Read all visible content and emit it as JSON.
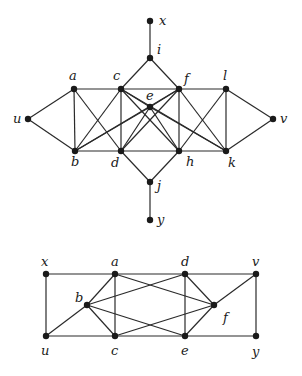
{
  "graphs": [
    {
      "id": "top-graph",
      "nodes": [
        {
          "id": "x",
          "label": "x",
          "x": 150,
          "y": 21,
          "lx": 159,
          "ly": 25
        },
        {
          "id": "i",
          "label": "i",
          "x": 150,
          "y": 58,
          "lx": 157,
          "ly": 54
        },
        {
          "id": "a",
          "label": "a",
          "x": 74,
          "y": 89,
          "lx": 69,
          "ly": 80
        },
        {
          "id": "c",
          "label": "c",
          "x": 121,
          "y": 89,
          "lx": 113,
          "ly": 80
        },
        {
          "id": "f",
          "label": "f",
          "x": 179,
          "y": 89,
          "lx": 184,
          "ly": 83
        },
        {
          "id": "l",
          "label": "l",
          "x": 226,
          "y": 89,
          "lx": 223,
          "ly": 80
        },
        {
          "id": "e",
          "label": "e",
          "x": 150,
          "y": 107,
          "lx": 146,
          "ly": 100
        },
        {
          "id": "u",
          "label": "u",
          "x": 28,
          "y": 119,
          "lx": 13,
          "ly": 123
        },
        {
          "id": "v",
          "label": "v",
          "x": 273,
          "y": 119,
          "lx": 280,
          "ly": 123
        },
        {
          "id": "b",
          "label": "b",
          "x": 75,
          "y": 151,
          "lx": 71,
          "ly": 166
        },
        {
          "id": "d",
          "label": "d",
          "x": 121,
          "y": 151,
          "lx": 111,
          "ly": 167
        },
        {
          "id": "h",
          "label": "h",
          "x": 179,
          "y": 151,
          "lx": 186,
          "ly": 166
        },
        {
          "id": "k",
          "label": "k",
          "x": 226,
          "y": 151,
          "lx": 228,
          "ly": 167
        },
        {
          "id": "j",
          "label": "j",
          "x": 150,
          "y": 182,
          "lx": 157,
          "ly": 190
        },
        {
          "id": "y",
          "label": "y",
          "x": 150,
          "y": 220,
          "lx": 157,
          "ly": 224
        }
      ],
      "edges": [
        [
          "x",
          "i"
        ],
        [
          "i",
          "c"
        ],
        [
          "i",
          "f"
        ],
        [
          "a",
          "c"
        ],
        [
          "c",
          "f"
        ],
        [
          "f",
          "l"
        ],
        [
          "u",
          "a"
        ],
        [
          "u",
          "b"
        ],
        [
          "l",
          "v"
        ],
        [
          "k",
          "v"
        ],
        [
          "a",
          "b"
        ],
        [
          "a",
          "d"
        ],
        [
          "c",
          "b"
        ],
        [
          "c",
          "d"
        ],
        [
          "c",
          "e"
        ],
        [
          "c",
          "h"
        ],
        [
          "c",
          "k"
        ],
        [
          "f",
          "e"
        ],
        [
          "f",
          "d"
        ],
        [
          "f",
          "h"
        ],
        [
          "f",
          "k"
        ],
        [
          "f",
          "b"
        ],
        [
          "l",
          "h"
        ],
        [
          "l",
          "k"
        ],
        [
          "e",
          "b"
        ],
        [
          "e",
          "d"
        ],
        [
          "e",
          "h"
        ],
        [
          "e",
          "k"
        ],
        [
          "b",
          "d"
        ],
        [
          "d",
          "h"
        ],
        [
          "h",
          "k"
        ],
        [
          "d",
          "j"
        ],
        [
          "h",
          "j"
        ],
        [
          "j",
          "y"
        ]
      ]
    },
    {
      "id": "bottom-graph",
      "nodes": [
        {
          "id": "x",
          "label": "x",
          "x": 46,
          "y": 274,
          "lx": 41,
          "ly": 266
        },
        {
          "id": "a",
          "label": "a",
          "x": 115,
          "y": 274,
          "lx": 111,
          "ly": 266
        },
        {
          "id": "d",
          "label": "d",
          "x": 185,
          "y": 274,
          "lx": 181,
          "ly": 266
        },
        {
          "id": "v",
          "label": "v",
          "x": 256,
          "y": 274,
          "lx": 252,
          "ly": 266
        },
        {
          "id": "b",
          "label": "b",
          "x": 87,
          "y": 305,
          "lx": 75,
          "ly": 302
        },
        {
          "id": "f",
          "label": "f",
          "x": 214,
          "y": 305,
          "lx": 223,
          "ly": 322
        },
        {
          "id": "u",
          "label": "u",
          "x": 46,
          "y": 336,
          "lx": 41,
          "ly": 355
        },
        {
          "id": "c",
          "label": "c",
          "x": 115,
          "y": 336,
          "lx": 111,
          "ly": 355
        },
        {
          "id": "e",
          "label": "e",
          "x": 185,
          "y": 336,
          "lx": 181,
          "ly": 355
        },
        {
          "id": "y",
          "label": "y",
          "x": 256,
          "y": 336,
          "lx": 252,
          "ly": 356
        }
      ],
      "edges": [
        [
          "x",
          "a"
        ],
        [
          "a",
          "d"
        ],
        [
          "d",
          "v"
        ],
        [
          "u",
          "c"
        ],
        [
          "c",
          "e"
        ],
        [
          "e",
          "y"
        ],
        [
          "x",
          "u"
        ],
        [
          "v",
          "y"
        ],
        [
          "a",
          "c"
        ],
        [
          "d",
          "e"
        ],
        [
          "u",
          "b"
        ],
        [
          "b",
          "a"
        ],
        [
          "b",
          "c"
        ],
        [
          "b",
          "d"
        ],
        [
          "b",
          "e"
        ],
        [
          "a",
          "f"
        ],
        [
          "c",
          "f"
        ],
        [
          "d",
          "f"
        ],
        [
          "e",
          "f"
        ],
        [
          "f",
          "v"
        ]
      ]
    }
  ]
}
